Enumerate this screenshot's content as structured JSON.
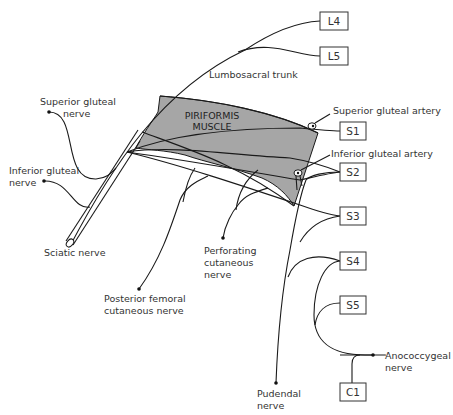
{
  "diagram": {
    "colors": {
      "muscle_fill": "#a6a6a6",
      "line": "#1a1a1a",
      "text": "#333333",
      "background": "#ffffff"
    },
    "nerve_roots": [
      {
        "id": "L4",
        "label": "L4"
      },
      {
        "id": "L5",
        "label": "L5"
      },
      {
        "id": "S1",
        "label": "S1"
      },
      {
        "id": "S2",
        "label": "S2"
      },
      {
        "id": "S3",
        "label": "S3"
      },
      {
        "id": "S4",
        "label": "S4"
      },
      {
        "id": "S5",
        "label": "S5"
      },
      {
        "id": "C1",
        "label": "C1"
      }
    ],
    "muscle": {
      "line1": "PIRIFORMIS",
      "line2": "MUSCLE"
    },
    "labels": {
      "lumbosacral_trunk": "Lumbosacral trunk",
      "superior_gluteal_artery": "Superior gluteal artery",
      "inferior_gluteal_artery": "Inferior gluteal artery",
      "superior_gluteal_nerve": {
        "line1": "Superior gluteal",
        "line2": "nerve"
      },
      "inferior_gluteal_nerve": {
        "line1": "Inferior gluteal",
        "line2": "nerve"
      },
      "sciatic_nerve": "Sciatic nerve",
      "perforating_cutaneous_nerve": {
        "line1": "Perforating",
        "line2": "cutaneous",
        "line3": "nerve"
      },
      "posterior_femoral_cutaneous_nerve": {
        "line1": "Posterior femoral",
        "line2": "cutaneous nerve"
      },
      "pudendal_nerve": {
        "line1": "Pudendal",
        "line2": "nerve"
      },
      "anococcygeal_nerve": {
        "line1": "Anococcygeal",
        "line2": "nerve"
      }
    }
  }
}
